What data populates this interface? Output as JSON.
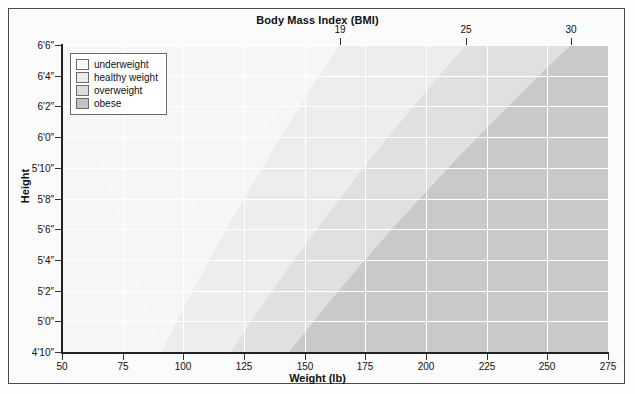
{
  "chart_data": {
    "type": "area",
    "title": "Body Mass Index (BMI)",
    "xlabel": "Weight (lb)",
    "ylabel": "Height",
    "xlim": [
      50,
      275
    ],
    "ylim_inches": [
      58,
      78
    ],
    "grid": true,
    "legend_position": "top-left inside plot",
    "x_ticks": [
      "50",
      "75",
      "100",
      "125",
      "150",
      "175",
      "200",
      "225",
      "250",
      "275"
    ],
    "x_tick_values": [
      50,
      75,
      100,
      125,
      150,
      175,
      200,
      225,
      250,
      275
    ],
    "y_ticks": [
      "4'10″",
      "5'0″",
      "5'2″",
      "5'4″",
      "5'6″",
      "5'8″",
      "5'10″",
      "6'0″",
      "6'2″",
      "6'4″",
      "6'6″"
    ],
    "y_tick_inches": [
      58,
      60,
      62,
      64,
      66,
      68,
      70,
      72,
      74,
      76,
      78
    ],
    "bmi_ticks": [
      "19",
      "25",
      "30"
    ],
    "bmi_tick_values": [
      19,
      25,
      30
    ],
    "bmi_tick_weights_at_top_height": [
      157,
      206,
      248
    ],
    "series": [
      {
        "name": "underweight",
        "bmi_range": [
          0,
          19
        ],
        "color": "#f6f6f6",
        "boundary_weights_lb": {
          "4'10″": 91,
          "6'6″": 157
        }
      },
      {
        "name": "healthy weight",
        "bmi_range": [
          19,
          25
        ],
        "color": "#ededed",
        "boundary_weights_lb": {
          "4'10″": 120,
          "6'6″": 206
        }
      },
      {
        "name": "overweight",
        "bmi_range": [
          25,
          30
        ],
        "color": "#e0e0e0",
        "boundary_weights_lb": {
          "4'10″": 143,
          "6'6″": 248
        }
      },
      {
        "name": "obese",
        "bmi_range": [
          30,
          null
        ],
        "color": "#c9c9c9",
        "boundary_weights_lb": {
          "4'10″": 143,
          "6'6″": 248
        }
      }
    ]
  },
  "legend": {
    "items": [
      {
        "label": "underweight",
        "color": "#f7f7f7"
      },
      {
        "label": "healthy weight",
        "color": "#ececec"
      },
      {
        "label": "overweight",
        "color": "#dcdcdc"
      },
      {
        "label": "obese",
        "color": "#c3c3c3"
      }
    ]
  },
  "titles": {
    "top": "Body Mass Index (BMI)",
    "bottom": "Weight (lb)",
    "left": "Height"
  }
}
